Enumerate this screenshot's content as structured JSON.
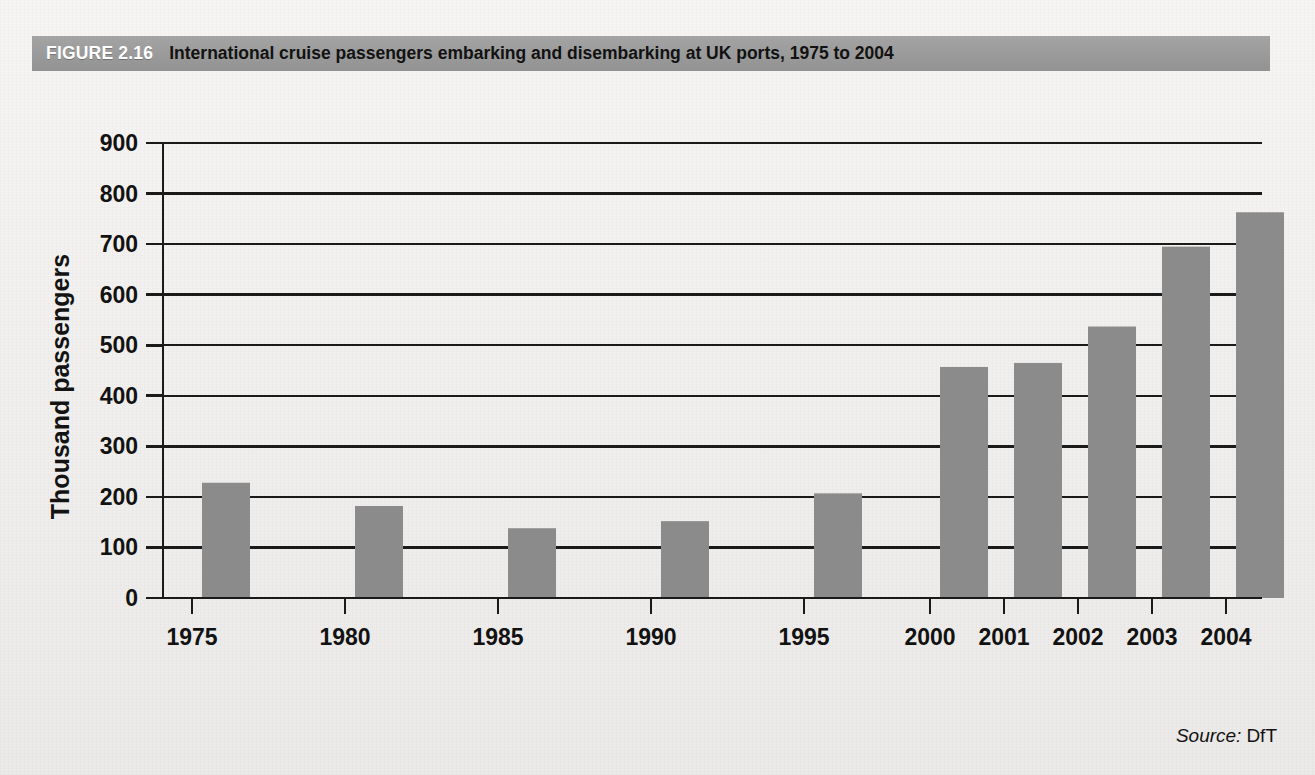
{
  "figure": {
    "number": "FIGURE 2.16",
    "title": "International cruise passengers embarking and disembarking at UK ports, 1975 to 2004",
    "header_bg": "#9b9b9b",
    "header_number_color": "#ffffff",
    "header_title_color": "#121212"
  },
  "source": {
    "label": "Source:",
    "value": "DfT"
  },
  "chart_data": {
    "type": "bar",
    "title": "International cruise passengers embarking and disembarking at UK ports, 1975 to 2004",
    "xlabel": "",
    "ylabel": "Thousand passengers",
    "categories": [
      "1975",
      "1980",
      "1985",
      "1990",
      "1995",
      "2000",
      "2001",
      "2002",
      "2003",
      "2004"
    ],
    "values": [
      228,
      182,
      138,
      152,
      207,
      457,
      465,
      537,
      695,
      763
    ],
    "ylim": [
      0,
      900
    ],
    "ytick_step": 100,
    "yticks": [
      "0",
      "100",
      "200",
      "300",
      "400",
      "500",
      "600",
      "700",
      "800",
      "900"
    ],
    "grid": true,
    "grid_axis": "y",
    "legend": false,
    "bar_color": "#8b8b8b",
    "axis_color": "#1a1a1a",
    "units": "thousand passengers"
  }
}
